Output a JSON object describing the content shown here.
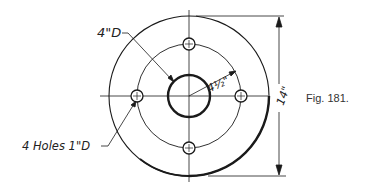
{
  "figure": {
    "caption": "Fig. 181."
  },
  "labels": {
    "hub_diameter": "4\"D",
    "bolt_circle_radius": "4½\"",
    "outer_diameter": "14\"",
    "holes": "4 Holes 1\"D"
  },
  "geometry": {
    "center": [
      189,
      96
    ],
    "outer_radius": 80,
    "bolt_circle_radius": 52,
    "hub_radius": 21,
    "hole_radius": 6,
    "hole_count": 4
  },
  "colors": {
    "line": "#1a1a1a",
    "background": "#ffffff"
  }
}
